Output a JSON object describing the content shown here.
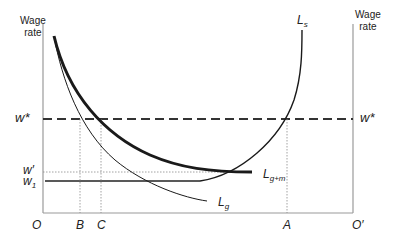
{
  "figure": {
    "left_axis_title_line1": "Wage",
    "left_axis_title_line2": "rate",
    "right_axis_title_line1": "Wage",
    "right_axis_title_line2": "rate",
    "origin_left": "O",
    "origin_right": "O′",
    "x_labels": {
      "B": "B",
      "C": "C",
      "A": "A"
    },
    "y_labels": {
      "w_star_left": "w*",
      "w_star_right": "w*",
      "w_prime": "w′",
      "w1_base": "w",
      "w1_sub": "1"
    },
    "curve_labels": {
      "Ls_base": "L",
      "Ls_sub": "s",
      "Lgm_base": "L",
      "Lgm_sub": "g+m",
      "Lg_base": "L",
      "Lg_sub": "g"
    },
    "colors": {
      "axis": "#9a9a9a",
      "curve": "#1a1a1a",
      "guide": "#8a8a8a"
    }
  }
}
